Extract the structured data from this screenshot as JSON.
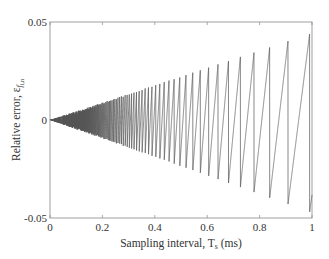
{
  "chart_data": {
    "type": "line",
    "title": "",
    "xlabel": "Sampling interval, T_s (ms)",
    "xlabel_main": "Sampling interval, T",
    "xlabel_sub": "s",
    "xlabel_unit": " (ms)",
    "ylabel": "Relative error, ε_{f_{i,n}}",
    "ylabel_main": "Relative error, ε",
    "ylabel_sub": "f",
    "ylabel_subsub": "i,n",
    "xlim": [
      0,
      1
    ],
    "ylim": [
      -0.05,
      0.05
    ],
    "xticks": [
      0,
      0.2,
      0.4,
      0.6,
      0.8,
      1
    ],
    "xtick_labels": [
      "0",
      "0.2",
      "0.4",
      "0.6",
      "0.8",
      "1"
    ],
    "yticks": [
      -0.05,
      0,
      0.05
    ],
    "ytick_labels": [
      "-0.05",
      "0",
      "0.05"
    ],
    "grid": false,
    "legend": null,
    "line_color": "#555555",
    "envelope": {
      "upper": [
        [
          0,
          0
        ],
        [
          0.2,
          0.0095
        ],
        [
          0.4,
          0.019
        ],
        [
          0.6,
          0.0285
        ],
        [
          0.8,
          0.038
        ],
        [
          0.96,
          0.0455
        ]
      ],
      "lower": [
        [
          0,
          0
        ],
        [
          0.2,
          -0.009
        ],
        [
          0.4,
          -0.018
        ],
        [
          0.6,
          -0.027
        ],
        [
          0.8,
          -0.036
        ],
        [
          0.96,
          -0.0425
        ]
      ]
    },
    "peaks": [
      {
        "x": 0.534,
        "y": 0.0245
      },
      {
        "x": 0.561,
        "y": 0.0262
      },
      {
        "x": 0.592,
        "y": 0.0278
      },
      {
        "x": 0.626,
        "y": 0.0296
      },
      {
        "x": 0.664,
        "y": 0.0315
      },
      {
        "x": 0.706,
        "y": 0.0335
      },
      {
        "x": 0.756,
        "y": 0.0357
      },
      {
        "x": 0.809,
        "y": 0.0383
      },
      {
        "x": 0.878,
        "y": 0.0418
      },
      {
        "x": 0.954,
        "y": 0.0454
      }
    ],
    "troughs": [
      {
        "x": 0.756,
        "y": -0.0331
      },
      {
        "x": 0.809,
        "y": -0.0357
      },
      {
        "x": 0.878,
        "y": -0.0388
      },
      {
        "x": 0.954,
        "y": -0.0423
      }
    ],
    "end_point": {
      "x": 1.0,
      "y": 0.0
    },
    "wrap_constant": 10.9
  }
}
